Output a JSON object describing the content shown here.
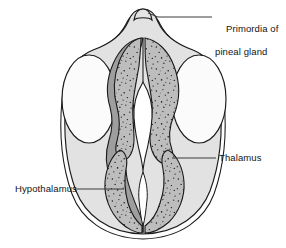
{
  "figure": {
    "kind": "anatomical-line-diagram",
    "width": 286,
    "height": 248,
    "background_color": "#ffffff"
  },
  "labels": {
    "pineal": {
      "line1": "Primordia of",
      "line2": "pineal gland"
    },
    "thalamus": {
      "text": "Thalamus"
    },
    "hypothalamus": {
      "text": "Hypothalamus"
    }
  },
  "structures": [
    {
      "id": "outer-mantle",
      "name": "outer mantle / neural wall",
      "fill": "#e2e2e2",
      "stroke": "#1a1a1a"
    },
    {
      "id": "hemisphere-oval-left",
      "name": "left lateral vesicle",
      "fill": "#fbfbfb",
      "stroke": "#1a1a1a"
    },
    {
      "id": "hemisphere-oval-right",
      "name": "right lateral vesicle",
      "fill": "#fbfbfb",
      "stroke": "#1a1a1a"
    },
    {
      "id": "ependymal-band-left",
      "name": "medial ependymal band",
      "fill": "#9e9e9e",
      "stroke": "#1a1a1a"
    },
    {
      "id": "thalamus-swelling-right",
      "name": "thalamus",
      "fill": "#bdbdbd",
      "stipple": true,
      "stroke": "#1a1a1a"
    },
    {
      "id": "thalamus-swelling-left",
      "name": "thalamus",
      "fill": "#bdbdbd",
      "stipple": true,
      "stroke": "#1a1a1a"
    },
    {
      "id": "hypothalamus-swelling-left",
      "name": "hypothalamus",
      "fill": "#bdbdbd",
      "stipple": true,
      "stroke": "#1a1a1a"
    },
    {
      "id": "hypothalamus-swelling-right",
      "name": "hypothalamus",
      "fill": "#bdbdbd",
      "stipple": true,
      "stroke": "#1a1a1a"
    },
    {
      "id": "third-ventricle",
      "name": "third ventricle cavity",
      "fill": "#ffffff",
      "stroke": "#1a1a1a"
    },
    {
      "id": "pineal-primordium",
      "name": "primordia of pineal gland",
      "fill": "#e2e2e2",
      "stroke": "#1a1a1a"
    }
  ],
  "leader_lines": [
    {
      "id": "leader-pineal",
      "from": [
        158,
        17
      ],
      "to": [
        212,
        17
      ]
    },
    {
      "id": "leader-thalamus",
      "from": [
        172,
        158
      ],
      "to": [
        216,
        158
      ]
    },
    {
      "id": "leader-hypothalamus",
      "from": [
        76,
        189
      ],
      "to": [
        124,
        189
      ]
    }
  ],
  "colors": {
    "stroke": "#1a1a1a",
    "stipple_dot": "#1f1f1f",
    "mantle": "#e2e2e2",
    "band": "#9e9e9e",
    "swelling": "#bdbdbd",
    "cavity": "#ffffff",
    "vesicle": "#fbfbfb",
    "label_text": "#141414",
    "leader": "#3a3a3a"
  }
}
